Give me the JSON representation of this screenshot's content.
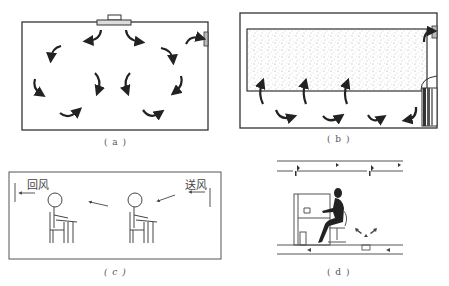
{
  "figure": {
    "panels": [
      {
        "id": "a",
        "caption": "( a )",
        "description": "ceiling diffuser mixing ventilation with circulating airflow arrows"
      },
      {
        "id": "b",
        "caption": "( b )",
        "description": "displacement ventilation with floor-level supply unit and upper stratified zone"
      },
      {
        "id": "c",
        "caption": "( c )",
        "description": "horizontal airflow across seated occupants",
        "labels": {
          "return_air": "回风",
          "supply_air": "送风"
        }
      },
      {
        "id": "d",
        "caption": "( d )",
        "description": "underfloor air distribution at a workstation with seated person"
      }
    ],
    "colors": {
      "line": "#333333",
      "arrow": "#222222",
      "speckle": "#888888",
      "background": "#ffffff"
    }
  }
}
